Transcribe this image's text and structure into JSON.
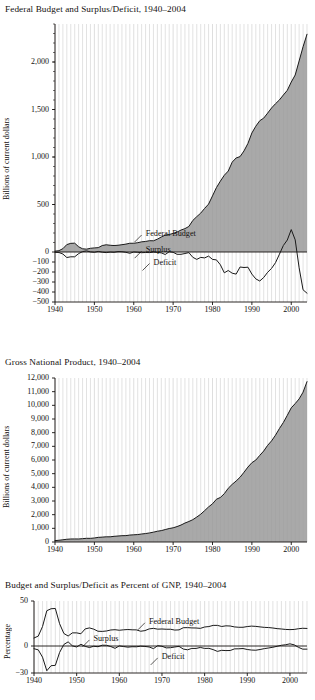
{
  "figure": {
    "background": "#ffffff",
    "ink": "#14110f",
    "gridline_color": "#d6d6d6",
    "area_fill": "#9a9a9a",
    "line_color": "#1a1a1a"
  },
  "charts": [
    {
      "id": "federal-budget",
      "type": "area",
      "title": "Federal Budget and Surplus/Deficit, 1940–2004",
      "ylabel": "Billions of current dollars",
      "xlabel": "",
      "xlim": [
        1940,
        2004
      ],
      "ylim": [
        -500,
        2400
      ],
      "yticks": [
        2000,
        1500,
        1000,
        500,
        0,
        -100,
        -200,
        -300,
        -400,
        -500
      ],
      "ytick_labels": [
        "2,000",
        "1,500",
        "1,000",
        "500",
        "0",
        "−100",
        "−200",
        "−300",
        "−400",
        "−500"
      ],
      "xticks": [
        1940,
        1950,
        1960,
        1970,
        1980,
        1990,
        2000
      ],
      "xtick_labels": [
        "1940",
        "1950",
        "1960",
        "1970",
        "1980",
        "1990",
        "2000"
      ],
      "grid": "vertical-yearly",
      "annotations": [
        {
          "label": "Federal Budget",
          "x": 1962,
          "y": 200
        },
        {
          "label": "Surplus",
          "x": 1962,
          "y": 30
        },
        {
          "label": "Deficit",
          "x": 1964,
          "y": -95
        }
      ],
      "series": [
        {
          "name": "Federal Budget",
          "style": "area",
          "x": [
            1940,
            1941,
            1942,
            1943,
            1944,
            1945,
            1946,
            1947,
            1948,
            1949,
            1950,
            1951,
            1952,
            1953,
            1954,
            1955,
            1956,
            1957,
            1958,
            1959,
            1960,
            1961,
            1962,
            1963,
            1964,
            1965,
            1966,
            1967,
            1968,
            1969,
            1970,
            1971,
            1972,
            1973,
            1974,
            1975,
            1976,
            1977,
            1978,
            1979,
            1980,
            1981,
            1982,
            1983,
            1984,
            1985,
            1986,
            1987,
            1988,
            1989,
            1990,
            1991,
            1992,
            1993,
            1994,
            1995,
            1996,
            1997,
            1998,
            1999,
            2000,
            2001,
            2002,
            2003,
            2004
          ],
          "values": [
            9,
            14,
            35,
            78,
            91,
            93,
            55,
            34,
            30,
            39,
            43,
            46,
            68,
            76,
            71,
            68,
            71,
            77,
            83,
            92,
            92,
            98,
            107,
            111,
            119,
            118,
            135,
            158,
            178,
            184,
            196,
            210,
            231,
            246,
            269,
            332,
            372,
            409,
            459,
            504,
            591,
            678,
            746,
            808,
            852,
            946,
            990,
            1004,
            1064,
            1143,
            1253,
            1324,
            1382,
            1409,
            1462,
            1516,
            1561,
            1601,
            1653,
            1702,
            1789,
            1863,
            2011,
            2160,
            2292
          ]
        },
        {
          "name": "Surplus/Deficit",
          "style": "line",
          "x": [
            1940,
            1941,
            1942,
            1943,
            1944,
            1945,
            1946,
            1947,
            1948,
            1949,
            1950,
            1951,
            1952,
            1953,
            1954,
            1955,
            1956,
            1957,
            1958,
            1959,
            1960,
            1961,
            1962,
            1963,
            1964,
            1965,
            1966,
            1967,
            1968,
            1969,
            1970,
            1971,
            1972,
            1973,
            1974,
            1975,
            1976,
            1977,
            1978,
            1979,
            1980,
            1981,
            1982,
            1983,
            1984,
            1985,
            1986,
            1987,
            1988,
            1989,
            1990,
            1991,
            1992,
            1993,
            1994,
            1995,
            1996,
            1997,
            1998,
            1999,
            2000,
            2001,
            2002,
            2003,
            2004
          ],
          "values": [
            -3,
            -5,
            -20,
            -55,
            -48,
            -48,
            -16,
            4,
            12,
            1,
            -3,
            6,
            -2,
            -6,
            -1,
            -3,
            4,
            3,
            -3,
            -13,
            0,
            -3,
            -7,
            -5,
            -6,
            -1,
            -4,
            -9,
            -25,
            3,
            -3,
            -23,
            -23,
            -15,
            -6,
            -53,
            -74,
            -54,
            -59,
            -41,
            -74,
            -79,
            -128,
            -208,
            -185,
            -212,
            -221,
            -150,
            -155,
            -152,
            -221,
            -269,
            -290,
            -255,
            -203,
            -164,
            -107,
            -22,
            69,
            126,
            236,
            128,
            -158,
            -378,
            -412
          ]
        }
      ]
    },
    {
      "id": "gross-national-product",
      "type": "area",
      "title": "Gross National Product, 1940–2004",
      "ylabel": "Billions of current dollars",
      "xlabel": "",
      "xlim": [
        1940,
        2004
      ],
      "ylim": [
        0,
        12000
      ],
      "yticks": [
        12000,
        11000,
        10000,
        9000,
        8000,
        7000,
        6000,
        5000,
        4000,
        3000,
        2000,
        1000,
        0
      ],
      "ytick_labels": [
        "12,000",
        "11,000",
        "10,000",
        "9,000",
        "8,000",
        "7,000",
        "6,000",
        "5,000",
        "4,000",
        "3,000",
        "2,000",
        "1,000",
        "0"
      ],
      "xticks": [
        1940,
        1950,
        1960,
        1970,
        1980,
        1990,
        2000
      ],
      "xtick_labels": [
        "1940",
        "1950",
        "1960",
        "1970",
        "1980",
        "1990",
        "2000"
      ],
      "grid": "vertical-yearly",
      "annotations": [],
      "series": [
        {
          "name": "Gross National Product",
          "style": "area",
          "x": [
            1940,
            1941,
            1942,
            1943,
            1944,
            1945,
            1946,
            1947,
            1948,
            1949,
            1950,
            1951,
            1952,
            1953,
            1954,
            1955,
            1956,
            1957,
            1958,
            1959,
            1960,
            1961,
            1962,
            1963,
            1964,
            1965,
            1966,
            1967,
            1968,
            1969,
            1970,
            1971,
            1972,
            1973,
            1974,
            1975,
            1976,
            1977,
            1978,
            1979,
            1980,
            1981,
            1982,
            1983,
            1984,
            1985,
            1986,
            1987,
            1988,
            1989,
            1990,
            1991,
            1992,
            1993,
            1994,
            1995,
            1996,
            1997,
            1998,
            1999,
            2000,
            2001,
            2002,
            2003,
            2004
          ],
          "values": [
            101,
            127,
            162,
            199,
            220,
            223,
            222,
            244,
            270,
            267,
            294,
            339,
            358,
            379,
            380,
            415,
            438,
            461,
            467,
            507,
            527,
            545,
            586,
            618,
            664,
            720,
            788,
            833,
            910,
            985,
            1039,
            1128,
            1241,
            1386,
            1501,
            1635,
            1824,
            2031,
            2295,
            2566,
            2796,
            3131,
            3259,
            3535,
            3933,
            4220,
            4463,
            4740,
            5104,
            5484,
            5803,
            5995,
            6338,
            6657,
            7072,
            7398,
            7817,
            8304,
            8747,
            9268,
            9817,
            10128,
            10470,
            10961,
            11734
          ]
        }
      ]
    },
    {
      "id": "percent-of-gnp",
      "type": "line",
      "title": "Budget and Surplus/Deficit as Percent of GNP, 1940–2004",
      "ylabel": "Percentage",
      "xlabel": "",
      "xlim": [
        1940,
        2004
      ],
      "ylim": [
        -30,
        50
      ],
      "yticks": [
        50,
        0,
        -30
      ],
      "ytick_labels": [
        "50",
        "0",
        "−30"
      ],
      "xticks": [
        1940,
        1950,
        1960,
        1970,
        1980,
        1990,
        2000
      ],
      "xtick_labels": [
        "1940",
        "1950",
        "1960",
        "1970",
        "1980",
        "1990",
        "2000"
      ],
      "grid": "vertical-yearly",
      "annotations": [
        {
          "label": "Federal Budget",
          "x": 1966,
          "y": 28
        },
        {
          "label": "Surplus",
          "x": 1953,
          "y": 9
        },
        {
          "label": "Deficit",
          "x": 1969,
          "y": -11
        }
      ],
      "series": [
        {
          "name": "Federal Budget",
          "style": "line",
          "x": [
            1940,
            1941,
            1942,
            1943,
            1944,
            1945,
            1946,
            1947,
            1948,
            1949,
            1950,
            1951,
            1952,
            1953,
            1954,
            1955,
            1956,
            1957,
            1958,
            1959,
            1960,
            1961,
            1962,
            1963,
            1964,
            1965,
            1966,
            1967,
            1968,
            1969,
            1970,
            1971,
            1972,
            1973,
            1974,
            1975,
            1976,
            1977,
            1978,
            1979,
            1980,
            1981,
            1982,
            1983,
            1984,
            1985,
            1986,
            1987,
            1988,
            1989,
            1990,
            1991,
            1992,
            1993,
            1994,
            1995,
            1996,
            1997,
            1998,
            1999,
            2000,
            2001,
            2002,
            2003,
            2004
          ],
          "values": [
            8.9,
            11.0,
            21.6,
            39.2,
            41.4,
            41.7,
            24.8,
            13.9,
            11.1,
            14.6,
            14.6,
            13.6,
            19.0,
            20.1,
            18.7,
            16.4,
            16.2,
            16.7,
            17.8,
            18.1,
            17.5,
            18.0,
            18.3,
            18.0,
            17.9,
            16.4,
            17.1,
            19.0,
            19.6,
            18.7,
            18.9,
            18.6,
            18.6,
            17.7,
            17.9,
            20.3,
            20.4,
            20.1,
            20.0,
            19.6,
            21.1,
            21.6,
            22.9,
            22.9,
            21.7,
            22.4,
            22.2,
            21.2,
            20.8,
            20.8,
            21.6,
            22.1,
            21.8,
            21.2,
            20.7,
            20.5,
            20.0,
            19.3,
            18.9,
            18.4,
            18.2,
            18.4,
            19.2,
            19.7,
            19.5
          ]
        },
        {
          "name": "Surplus/Deficit",
          "style": "line",
          "x": [
            1940,
            1941,
            1942,
            1943,
            1944,
            1945,
            1946,
            1947,
            1948,
            1949,
            1950,
            1951,
            1952,
            1953,
            1954,
            1955,
            1956,
            1957,
            1958,
            1959,
            1960,
            1961,
            1962,
            1963,
            1964,
            1965,
            1966,
            1967,
            1968,
            1969,
            1970,
            1971,
            1972,
            1973,
            1974,
            1975,
            1976,
            1977,
            1978,
            1979,
            1980,
            1981,
            1982,
            1983,
            1984,
            1985,
            1986,
            1987,
            1988,
            1989,
            1990,
            1991,
            1992,
            1993,
            1994,
            1995,
            1996,
            1997,
            1998,
            1999,
            2000,
            2001,
            2002,
            2003,
            2004
          ],
          "values": [
            -3.0,
            -4.3,
            -12.4,
            -27.5,
            -21.9,
            -21.5,
            -7.2,
            1.7,
            4.6,
            0.2,
            -1.1,
            1.9,
            -0.4,
            -1.7,
            -0.3,
            -0.8,
            0.9,
            0.8,
            -0.6,
            -2.6,
            0.1,
            -0.6,
            -1.3,
            -0.8,
            -0.9,
            -0.2,
            -0.5,
            -1.1,
            -2.9,
            0.3,
            -0.3,
            -2.1,
            -1.9,
            -1.1,
            -0.4,
            -3.4,
            -4.2,
            -2.7,
            -2.7,
            -1.6,
            -2.7,
            -2.6,
            -4.0,
            -6.0,
            -4.8,
            -5.1,
            -5.0,
            -3.2,
            -3.1,
            -2.8,
            -3.9,
            -4.5,
            -4.7,
            -3.9,
            -2.9,
            -2.2,
            -1.4,
            -0.3,
            0.8,
            1.4,
            2.4,
            1.3,
            -1.5,
            -3.5,
            -3.5
          ]
        }
      ]
    }
  ]
}
